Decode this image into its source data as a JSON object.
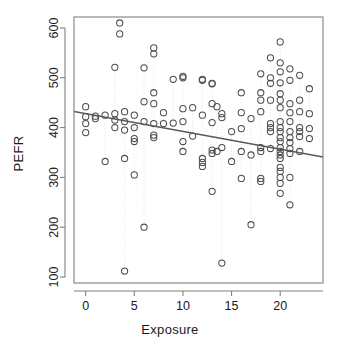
{
  "chart_data": {
    "type": "scatter",
    "title": "",
    "xlabel": "Exposure",
    "ylabel": "PEFR",
    "xlim": [
      -1.2,
      24.4
    ],
    "ylim": [
      88,
      622
    ],
    "xticks": [
      0,
      5,
      10,
      15,
      20
    ],
    "yticks": [
      100,
      200,
      300,
      400,
      500,
      600
    ],
    "grid": "dotted vertical gridlines at each observed exposure value",
    "legend": "none",
    "marker": "open-circle",
    "marker_color": "#4d4d4d",
    "fit_line": {
      "type": "linear-regression",
      "color": "#595959",
      "x_start": 0.0,
      "y_start": 428,
      "x_end": 23.5,
      "y_end": 344,
      "intercept": 428,
      "slope": -3.57
    },
    "points": [
      [
        0,
        442
      ],
      [
        0,
        422
      ],
      [
        0,
        408
      ],
      [
        0,
        390
      ],
      [
        1,
        423
      ],
      [
        1,
        418
      ],
      [
        2,
        425
      ],
      [
        2,
        332
      ],
      [
        3,
        521
      ],
      [
        3,
        428
      ],
      [
        3,
        415
      ],
      [
        3,
        400
      ],
      [
        3.5,
        610
      ],
      [
        3.5,
        588
      ],
      [
        4,
        432
      ],
      [
        4,
        412
      ],
      [
        4,
        395
      ],
      [
        4,
        338
      ],
      [
        4,
        112
      ],
      [
        5,
        425
      ],
      [
        5,
        400
      ],
      [
        5,
        378
      ],
      [
        5,
        372
      ],
      [
        5,
        305
      ],
      [
        6,
        520
      ],
      [
        6,
        452
      ],
      [
        6,
        412
      ],
      [
        6,
        200
      ],
      [
        7,
        560
      ],
      [
        7,
        548
      ],
      [
        7,
        470
      ],
      [
        7,
        448
      ],
      [
        7,
        408
      ],
      [
        7,
        385
      ],
      [
        7,
        380
      ],
      [
        8,
        430
      ],
      [
        8,
        408
      ],
      [
        9,
        497
      ],
      [
        9,
        409
      ],
      [
        10,
        503
      ],
      [
        10,
        500
      ],
      [
        10,
        438
      ],
      [
        10,
        412
      ],
      [
        10,
        372
      ],
      [
        10,
        352
      ],
      [
        11,
        440
      ],
      [
        11,
        383
      ],
      [
        12,
        497
      ],
      [
        12,
        495
      ],
      [
        12,
        425
      ],
      [
        12,
        338
      ],
      [
        12,
        330
      ],
      [
        12,
        322
      ],
      [
        13,
        489
      ],
      [
        13,
        488
      ],
      [
        13,
        448
      ],
      [
        13,
        410
      ],
      [
        13,
        355
      ],
      [
        13,
        348
      ],
      [
        13,
        272
      ],
      [
        13.5,
        442
      ],
      [
        13.5,
        352
      ],
      [
        14,
        428
      ],
      [
        14,
        420
      ],
      [
        14,
        360
      ],
      [
        14,
        128
      ],
      [
        15,
        392
      ],
      [
        15,
        332
      ],
      [
        16,
        470
      ],
      [
        16,
        430
      ],
      [
        16,
        398
      ],
      [
        16,
        352
      ],
      [
        16,
        298
      ],
      [
        17,
        418
      ],
      [
        17,
        345
      ],
      [
        17,
        205
      ],
      [
        18,
        508
      ],
      [
        18,
        470
      ],
      [
        18,
        455
      ],
      [
        18,
        432
      ],
      [
        18,
        360
      ],
      [
        18,
        352
      ],
      [
        18,
        298
      ],
      [
        18,
        292
      ],
      [
        19,
        540
      ],
      [
        19,
        500
      ],
      [
        19,
        489
      ],
      [
        19,
        455
      ],
      [
        19,
        408
      ],
      [
        19,
        400
      ],
      [
        19,
        392
      ],
      [
        19,
        358
      ],
      [
        20,
        572
      ],
      [
        20,
        530
      ],
      [
        20,
        512
      ],
      [
        20,
        490
      ],
      [
        20,
        468
      ],
      [
        20,
        455
      ],
      [
        20,
        440
      ],
      [
        20,
        412
      ],
      [
        20,
        400
      ],
      [
        20,
        392
      ],
      [
        20,
        380
      ],
      [
        20,
        372
      ],
      [
        20,
        360
      ],
      [
        20,
        352
      ],
      [
        20,
        345
      ],
      [
        20,
        338
      ],
      [
        20,
        320
      ],
      [
        20,
        312
      ],
      [
        20,
        300
      ],
      [
        20,
        288
      ],
      [
        20,
        268
      ],
      [
        21,
        518
      ],
      [
        21,
        495
      ],
      [
        21,
        448
      ],
      [
        21,
        430
      ],
      [
        21,
        412
      ],
      [
        21,
        392
      ],
      [
        21,
        380
      ],
      [
        21,
        370
      ],
      [
        21,
        358
      ],
      [
        21,
        348
      ],
      [
        21,
        300
      ],
      [
        21,
        245
      ],
      [
        22,
        505
      ],
      [
        22,
        455
      ],
      [
        22,
        432
      ],
      [
        22,
        400
      ],
      [
        22,
        392
      ],
      [
        22,
        382
      ],
      [
        22,
        352
      ],
      [
        23,
        478
      ],
      [
        23,
        428
      ],
      [
        23,
        398
      ],
      [
        23,
        378
      ]
    ]
  }
}
